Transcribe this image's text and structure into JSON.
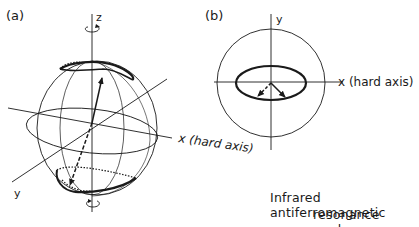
{
  "panel_a": {
    "label": "(a)",
    "z_label": "z",
    "x_label": "x (hard axis)",
    "y_label": "y"
  },
  "panel_b": {
    "label": "(b)",
    "y_label": "y",
    "x_label": "x (hard axis)"
  },
  "caption": {
    "line1": "Infrared antiferromagnetic",
    "line2": "resonance mode"
  },
  "colors": {
    "line": "#1a1a1a",
    "background": "#ffffff"
  }
}
